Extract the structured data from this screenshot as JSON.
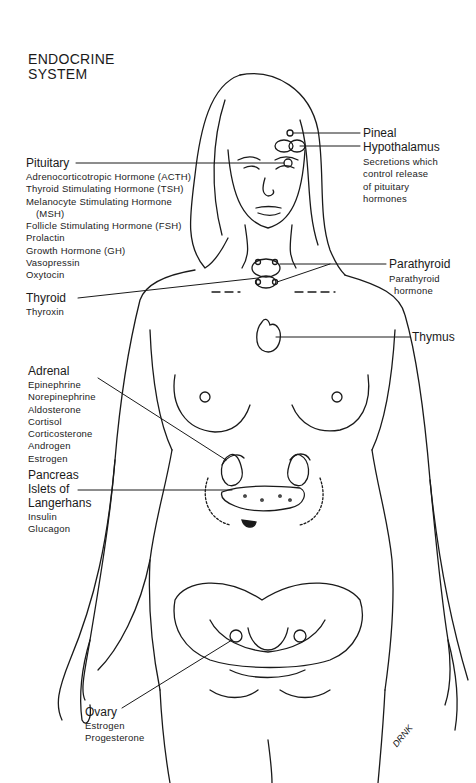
{
  "title": {
    "line1": "ENDOCRINE",
    "line2": "SYSTEM"
  },
  "glands": {
    "pineal": {
      "name": "Pineal"
    },
    "hypothalamus": {
      "name": "Hypothalamus",
      "description": [
        "Secretions which",
        "control release",
        "of pituitary",
        "hormones"
      ]
    },
    "pituitary": {
      "name": "Pituitary",
      "hormones": [
        "Adrenocorticotropic Hormone (ACTH)",
        "Thyroid Stimulating Hormone (TSH)",
        "Melanocyte Stimulating Hormone",
        "(MSH)",
        "Follicle Stimulating Hormone (FSH)",
        "Prolactin",
        "Growth Hormone (GH)",
        "Vasopressin",
        "Oxytocin"
      ]
    },
    "parathyroid": {
      "name": "Parathyroid",
      "hormones": [
        "Parathyroid",
        "hormone"
      ]
    },
    "thyroid": {
      "name": "Thyroid",
      "hormones": [
        "Thyroxin"
      ]
    },
    "thymus": {
      "name": "Thymus"
    },
    "adrenal": {
      "name": "Adrenal",
      "hormones": [
        "Epinephrine",
        "Norepinephrine",
        "Aldosterone",
        "Cortisol",
        "Corticosterone",
        "Androgen",
        "Estrogen"
      ]
    },
    "pancreas": {
      "name": "Pancreas",
      "subname": [
        "Islets of",
        "Langerhans"
      ],
      "hormones": [
        "Insulin",
        "Glucagon"
      ]
    },
    "ovary": {
      "name": "Ovary",
      "hormones": [
        "Estrogen",
        "Progesterone"
      ]
    }
  },
  "signature": "DRNK",
  "colors": {
    "ink": "#1a1a1a",
    "background": "#ffffff"
  }
}
